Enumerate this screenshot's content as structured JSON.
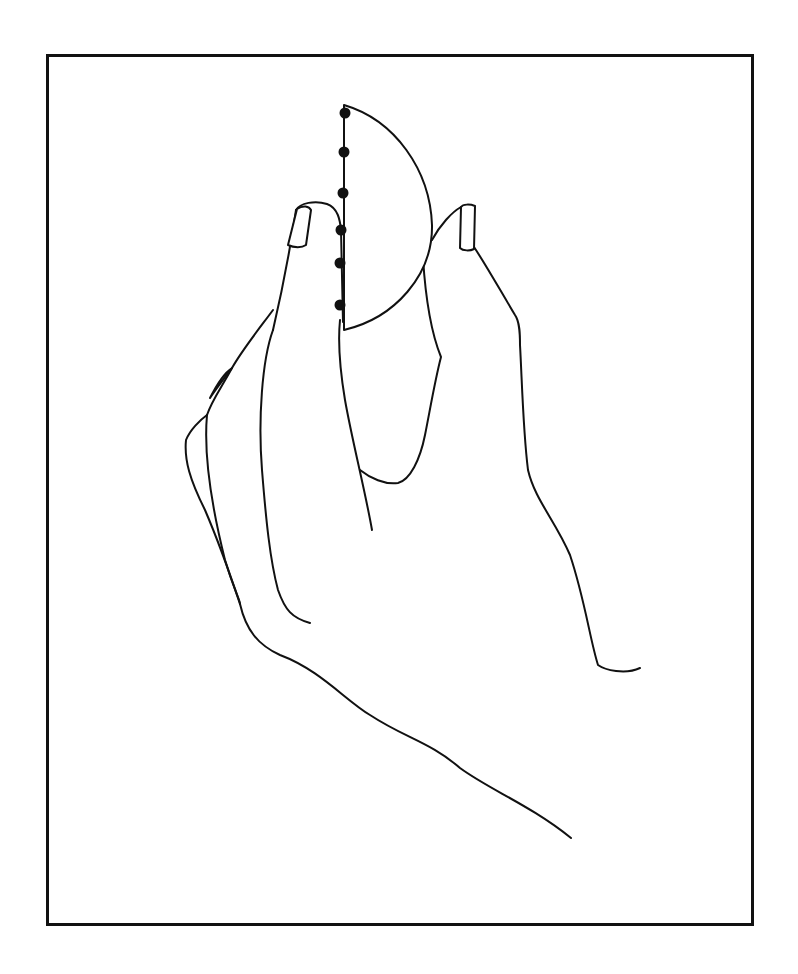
{
  "figure": {
    "canvas": {
      "width": 798,
      "height": 974
    },
    "frame": {
      "x": 46,
      "y": 54,
      "width": 702,
      "height": 866,
      "stroke": "#111111",
      "stroke_width": 3
    },
    "colors": {
      "ink": "#111111",
      "background": "#ffffff"
    },
    "semicircle": {
      "flat_edge": {
        "x1": 344,
        "y1": 105,
        "x2": 344,
        "y2": 330
      },
      "arc_path": "M344,105 C395,120 430,170 432,225 C433,275 395,318 344,330 Z"
    },
    "dots": [
      {
        "x": 345,
        "y": 113
      },
      {
        "x": 344,
        "y": 152
      },
      {
        "x": 343,
        "y": 193
      },
      {
        "x": 341,
        "y": 230
      },
      {
        "x": 340,
        "y": 263
      },
      {
        "x": 340,
        "y": 305
      }
    ],
    "paths": {
      "index_finger_outer": "M296,210 C290,250 280,300 273,330",
      "index_finger_tip": "M296,210 C300,203 315,200 327,204 C338,208 340,220 341,230",
      "index_finger_inner": "M341,230 L343,322",
      "index_nail": "M297,209 C303,205 309,206 311,210 L306,245 C302,248 294,248 288,245 Z",
      "index_finger_side_edge": "M340,320 C338,340 340,370 345,400 C352,440 365,490 372,530",
      "middle_finger": "M273,310 C262,325 242,350 232,368 C220,390 212,400 207,415",
      "middle_knuckle_fold": "M232,368 C224,373 218,382 210,398 C215,390 226,376 232,368",
      "ring_finger_outer": "M207,415 C200,420 190,430 186,440 C184,460 190,480 205,510 C220,545 232,580 240,604",
      "ring_finger_inner": "M207,415 C203,460 215,520 225,560 C234,590 240,600 240,604",
      "pinky_line": "M273,330 C262,360 258,420 262,470 C266,520 270,560 278,590 C285,610 292,618 310,623",
      "palm_bottom": "M240,604 C246,630 258,645 280,655 C320,670 345,700 370,715 C405,738 430,742 460,768 C490,790 530,805 571,838",
      "thumb_nail": "M461,207 C463,204 470,204 475,206 L474,249 C470,251 463,251 460,248 Z",
      "thumb_outer": "M474,247 C486,265 500,290 515,315 C520,322 520,335 520,345 C522,380 523,430 528,470 C535,500 555,520 570,555 C585,600 590,640 598,665 C605,670 625,675 640,668",
      "thumb_tip": "M461,207 C452,212 440,225 432,240",
      "thumb_inner": "M423,258 C425,290 430,330 441,357 C435,380 430,410 425,435 C420,460 410,480 398,483 C385,485 370,478 360,470"
    }
  }
}
